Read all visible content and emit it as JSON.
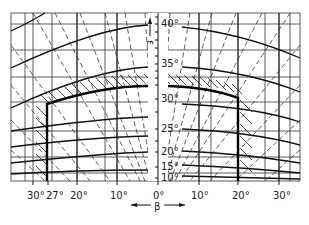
{
  "diagram": {
    "type": "technical projection grid chart",
    "vertical_axis": {
      "symbol": "ε",
      "labels": [
        "40°",
        "35°",
        "30°",
        "25°",
        "20°",
        "15°",
        "10°"
      ]
    },
    "horizontal_axis": {
      "symbol": "β",
      "labels_left": [
        "30°",
        "27°",
        "20°",
        "10°"
      ],
      "center_label": "0°",
      "labels_right": [
        "10°",
        "20°",
        "30°"
      ]
    },
    "boundary": {
      "description": "heavy outline with hatched top edge",
      "left_limit": "27°",
      "right_limit": "20°",
      "top_limit": "≈ 31°"
    },
    "colors": {
      "line": "#111111",
      "background": "#ffffff"
    }
  }
}
